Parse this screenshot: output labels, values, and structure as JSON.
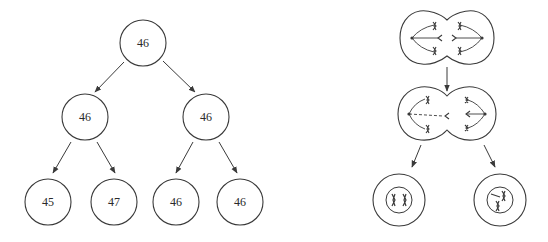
{
  "left_tree": {
    "root": {
      "label": "46",
      "cx": 143,
      "cy": 43
    },
    "level2": [
      {
        "label": "46",
        "cx": 85,
        "cy": 117
      },
      {
        "label": "46",
        "cx": 206,
        "cy": 117
      }
    ],
    "leaves": [
      {
        "label": "45",
        "cx": 48,
        "cy": 202
      },
      {
        "label": "47",
        "cx": 114,
        "cy": 202
      },
      {
        "label": "46",
        "cx": 176,
        "cy": 202
      },
      {
        "label": "46",
        "cx": 240,
        "cy": 202
      }
    ],
    "radius": 23
  },
  "right_diagram": {
    "description": "cell division with nondisjunction",
    "top_cell": {
      "type": "dividing-cell",
      "stage": "anaphase"
    },
    "middle_cell": {
      "type": "dividing-cell",
      "stage": "late-anaphase-lagging-chromosome"
    },
    "bottom_cells": [
      {
        "type": "daughter-cell",
        "chromosomes": 2
      },
      {
        "type": "daughter-cell",
        "chromosomes": 3
      }
    ]
  },
  "colors": {
    "line": "#3a3a3a",
    "text": "#2a2a2a",
    "background": "#ffffff"
  }
}
